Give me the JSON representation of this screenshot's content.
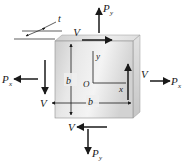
{
  "figure": {
    "background_color": "#ffffff",
    "line_color": "#1a1a1a"
  },
  "body": {
    "shape": "square-plate-3d",
    "face_fill_light": "#f2f2f2",
    "face_fill_mid": "#d9d9d9",
    "face_fill_dark": "#bfbfbf",
    "edge_color": "#8c8c8c"
  },
  "dimensions": {
    "thickness_label": "t",
    "width_label": "b",
    "height_label": "b"
  },
  "axes": {
    "origin_label": "O",
    "x_label": "x",
    "y_label": "y"
  },
  "forces": {
    "normal": [
      {
        "label": "P",
        "subscript": "y",
        "position": "top",
        "direction": "up"
      },
      {
        "label": "P",
        "subscript": "y",
        "position": "bottom",
        "direction": "down"
      },
      {
        "label": "P",
        "subscript": "x",
        "position": "left",
        "direction": "left"
      },
      {
        "label": "P",
        "subscript": "x",
        "position": "right",
        "direction": "right"
      }
    ],
    "shear": [
      {
        "label": "V",
        "position": "top",
        "direction": "right"
      },
      {
        "label": "V",
        "position": "bottom",
        "direction": "left"
      },
      {
        "label": "V",
        "position": "left",
        "direction": "down"
      },
      {
        "label": "V",
        "position": "right",
        "direction": "up"
      }
    ]
  }
}
